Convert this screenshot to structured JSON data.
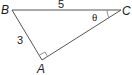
{
  "diagram": {
    "type": "right-triangle",
    "vertices": {
      "A": {
        "label": "A",
        "x": 42,
        "y": 60
      },
      "B": {
        "label": "B",
        "x": 12,
        "y": 10
      },
      "C": {
        "label": "C",
        "x": 121,
        "y": 10
      }
    },
    "sides": {
      "BC": {
        "label": "5"
      },
      "AB": {
        "label": "3"
      }
    },
    "angle_C": {
      "label": "θ"
    },
    "right_angle_at": "A",
    "stroke_color": "#555555"
  }
}
